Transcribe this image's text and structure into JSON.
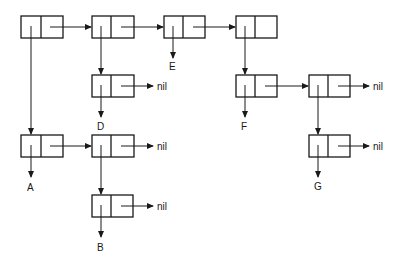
{
  "diagram": {
    "type": "cons-cell linked structure",
    "cells": [
      {
        "id": "c1",
        "x": 21,
        "y": 16,
        "car": "c_a",
        "cdr": "c2"
      },
      {
        "id": "c2",
        "x": 92,
        "y": 16,
        "car": "c_d",
        "cdr": "c3"
      },
      {
        "id": "c3",
        "x": 164,
        "y": 16,
        "car": "E",
        "cdr": "c4"
      },
      {
        "id": "c4",
        "x": 236,
        "y": 16,
        "car": "c_f",
        "cdr": ""
      },
      {
        "id": "c_d",
        "x": 92,
        "y": 75,
        "car": "D",
        "cdr": "nil"
      },
      {
        "id": "c_f",
        "x": 236,
        "y": 75,
        "car": "F",
        "cdr": "c_g1"
      },
      {
        "id": "c_g1",
        "x": 309,
        "y": 75,
        "car": "c_g",
        "cdr": "nil"
      },
      {
        "id": "c_a",
        "x": 21,
        "y": 135,
        "car": "A",
        "cdr": "c_ab"
      },
      {
        "id": "c_ab",
        "x": 92,
        "y": 135,
        "car": "c_b",
        "cdr": "nil"
      },
      {
        "id": "c_b",
        "x": 92,
        "y": 195,
        "car": "B",
        "cdr": "nil"
      },
      {
        "id": "c_g",
        "x": 309,
        "y": 135,
        "car": "G",
        "cdr": "nil"
      }
    ],
    "labels": {
      "a": "A",
      "b": "B",
      "d": "D",
      "e": "E",
      "f": "F",
      "g": "G",
      "nil": "nil"
    }
  }
}
